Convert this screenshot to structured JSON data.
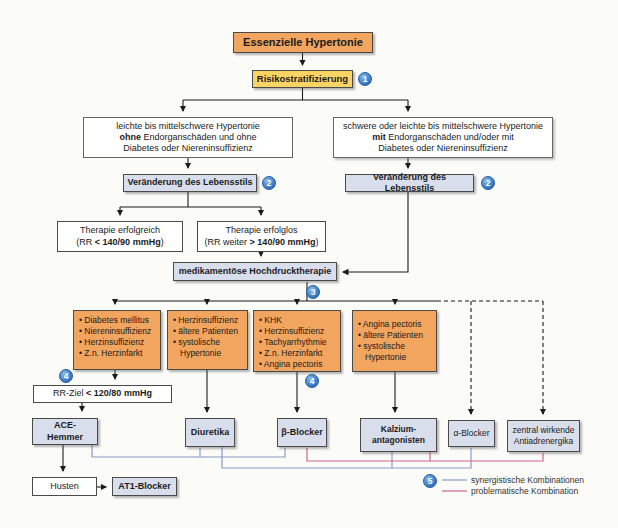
{
  "palette": {
    "orange": "#f2a55e",
    "yellow": "#fbd463",
    "blue_box": "#d9deec",
    "circle_blue": "#2f6fbd",
    "synergistic_line": "#8c9cc9",
    "problematic_line": "#d0648f"
  },
  "steps": {
    "s1": "1",
    "s2": "2",
    "s3": "3",
    "s4": "4",
    "s5": "5"
  },
  "nodes": {
    "title": "Essenzielle Hypertonie",
    "risk": "Risikostratifizierung",
    "branch_left": {
      "l1": "leichte bis mittelschwere Hypertonie",
      "l2b": "ohne",
      "l2": " Endorganschäden und ohne",
      "l3": "Diabetes oder Niereninsuffizienz"
    },
    "branch_right": {
      "l1": "schwere oder leichte bis mittelschwere Hypertonie",
      "l2b": "mit",
      "l2": " Endorganschäden und/oder mit",
      "l3": "Diabetes oder Niereninsuffizienz"
    },
    "lifestyle": "Veränderung des Lebensstils",
    "therapy_success": {
      "l1": "Therapie erfolgreich",
      "l2a": "(RR ",
      "l2b": "< 140/90 mmHg",
      "l2c": ")"
    },
    "therapy_fail": {
      "l1": "Therapie erfolglos",
      "l2a": "(RR weiter ",
      "l2b": "> 140/90 mmHg",
      "l2c": ")"
    },
    "medication": "medikamentöse Hochdrucktherapie",
    "indication_a": {
      "items": [
        "• Diabetes mellitus",
        "• Niereninsuffizienz",
        "• Herzinsuffizienz",
        "• Z.n. Herzinfarkt"
      ]
    },
    "indication_b": {
      "items": [
        "• Herzinsuffizienz",
        "• ältere Patienten",
        "• systolische Hypertonie"
      ]
    },
    "indication_c": {
      "items": [
        "• KHK",
        "• Herzinsuffizienz",
        "• Tachyarrhythmie",
        "• Z.n. Herzinfarkt",
        "• Angina pectoris"
      ]
    },
    "indication_d": {
      "items": [
        "• Angina pectoris",
        "• ältere Patienten",
        "• systolische Hypertonie"
      ]
    },
    "rr_goal": {
      "a": "RR-Ziel ",
      "b": "< 120/80 mmHg"
    },
    "drug_ace": "ACE-Hemmer",
    "drug_diuretic": "Diuretika",
    "drug_beta": "β-Blocker",
    "drug_calcium": {
      "l1": "Kalzium-",
      "l2": "antagonisten"
    },
    "drug_alpha": "α-Blocker",
    "drug_central": {
      "l1": "zentral wirkende",
      "l2": "Antiadrenergika"
    },
    "cough": "Husten",
    "drug_at1": "AT1-Blocker"
  },
  "legend": {
    "synergistic": "synergistische Kombinationen",
    "problematic": "problematische Kombination"
  },
  "combinations": {
    "synergistic": [
      [
        "ACE-Hemmer",
        "Diuretika"
      ],
      [
        "Diuretika",
        "β-Blocker"
      ],
      [
        "Diuretika",
        "Kalzium-antagonisten"
      ],
      [
        "Diuretika",
        "α-Blocker"
      ]
    ],
    "problematic": [
      [
        "β-Blocker",
        "Kalzium-antagonisten"
      ],
      [
        "β-Blocker",
        "zentral wirkende Antiadrenergika"
      ]
    ]
  }
}
